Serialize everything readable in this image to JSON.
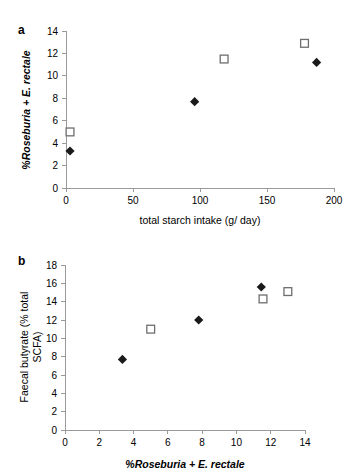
{
  "figure": {
    "background_color": "#ffffff",
    "marker_filled_color": "#1a1a1a",
    "marker_open_color": "#6e6e6e",
    "axis_color": "#9a9a9a"
  },
  "panel_a": {
    "letter": "a",
    "chart_data": {
      "type": "scatter",
      "title": "",
      "xlabel": "total starch intake (g/ day)",
      "ylabel": "%Roseburia + E. rectale",
      "xlim": [
        0,
        200
      ],
      "ylim": [
        0,
        14
      ],
      "xticks": [
        0,
        50,
        100,
        150,
        200
      ],
      "xtick_labels": [
        "0",
        "50",
        "100",
        "150",
        "200"
      ],
      "yticks": [
        0,
        2,
        4,
        6,
        8,
        10,
        12,
        14
      ],
      "ytick_labels": [
        "0",
        "2",
        "4",
        "6",
        "8",
        "10",
        "12",
        "14"
      ],
      "grid": false,
      "legend": "none",
      "series": [
        {
          "name": "filled-diamond",
          "marker": "filled-diamond",
          "points": [
            {
              "x": 3,
              "y": 3.3
            },
            {
              "x": 96,
              "y": 7.7
            },
            {
              "x": 187,
              "y": 11.2
            }
          ]
        },
        {
          "name": "open-square",
          "marker": "open-square",
          "points": [
            {
              "x": 3,
              "y": 5.0
            },
            {
              "x": 118,
              "y": 11.5
            },
            {
              "x": 178,
              "y": 12.9
            }
          ]
        }
      ]
    }
  },
  "panel_b": {
    "letter": "b",
    "chart_data": {
      "type": "scatter",
      "title": "",
      "xlabel": "%Roseburia + E. rectale",
      "ylabel": "Faecal butyrate (% total SCFA)",
      "ylabel_line1": "Faecal butyrate (% total",
      "ylabel_line2": "SCFA)",
      "xlim": [
        0,
        14
      ],
      "ylim": [
        0,
        18
      ],
      "xticks": [
        0,
        2,
        4,
        6,
        8,
        10,
        12,
        14
      ],
      "xtick_labels": [
        "0",
        "2",
        "4",
        "6",
        "8",
        "10",
        "12",
        "14"
      ],
      "yticks": [
        0,
        2,
        4,
        6,
        8,
        10,
        12,
        14,
        16,
        18
      ],
      "ytick_labels": [
        "0",
        "2",
        "4",
        "6",
        "8",
        "10",
        "12",
        "14",
        "16",
        "18"
      ],
      "grid": false,
      "legend": "none",
      "series": [
        {
          "name": "filled-diamond",
          "marker": "filled-diamond",
          "points": [
            {
              "x": 3.35,
              "y": 7.7
            },
            {
              "x": 7.8,
              "y": 12.0
            },
            {
              "x": 11.45,
              "y": 15.6
            }
          ]
        },
        {
          "name": "open-square",
          "marker": "open-square",
          "points": [
            {
              "x": 5.0,
              "y": 11.0
            },
            {
              "x": 11.55,
              "y": 14.3
            },
            {
              "x": 13.0,
              "y": 15.1
            }
          ]
        }
      ]
    }
  }
}
